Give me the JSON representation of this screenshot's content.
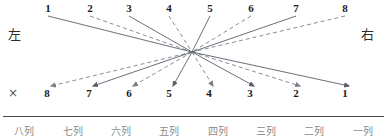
{
  "diagram": {
    "title": "",
    "side_labels": {
      "left": "左",
      "right": "右"
    },
    "cross_mark": "×",
    "geometry": {
      "converge_x": 192,
      "converge_y": 52,
      "top_label_y": 11,
      "bottom_label_y": 93,
      "top_line_start_y": 16,
      "bottom_line_end_y": 86
    },
    "colors": {
      "line": "#5a5f6b",
      "dash": "#7a7f8a",
      "text": "#1a1a1a",
      "rule": "#4a4a4a",
      "column_text": "#8a8a8a"
    },
    "top_nodes": [
      {
        "label": "1",
        "x": 44,
        "style": "solid"
      },
      {
        "label": "2",
        "x": 86,
        "style": "dashed"
      },
      {
        "label": "3",
        "x": 125,
        "style": "solid"
      },
      {
        "label": "4",
        "x": 165,
        "style": "dashed"
      },
      {
        "label": "5",
        "x": 206,
        "style": "solid"
      },
      {
        "label": "6",
        "x": 247,
        "style": "dashed"
      },
      {
        "label": "7",
        "x": 292,
        "style": "solid"
      },
      {
        "label": "8",
        "x": 341,
        "style": "dashed"
      }
    ],
    "bottom_nodes": [
      {
        "label": "8",
        "x": 46,
        "style": "dashed"
      },
      {
        "label": "7",
        "x": 88,
        "style": "solid"
      },
      {
        "label": "6",
        "x": 128,
        "style": "dashed"
      },
      {
        "label": "5",
        "x": 168,
        "style": "solid"
      },
      {
        "label": "4",
        "x": 208,
        "style": "dashed"
      },
      {
        "label": "3",
        "x": 249,
        "style": "solid"
      },
      {
        "label": "2",
        "x": 295,
        "style": "dashed"
      },
      {
        "label": "1",
        "x": 344,
        "style": "solid"
      }
    ],
    "column_labels": [
      "八列",
      "七列",
      "六列",
      "五列",
      "四列",
      "三列",
      "二列",
      "一列"
    ]
  }
}
